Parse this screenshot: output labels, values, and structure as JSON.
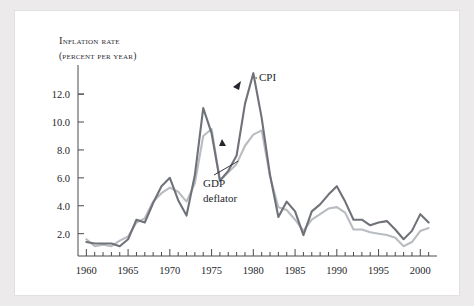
{
  "figure": {
    "title_line1": "Inflation rate",
    "title_line2": "(percent per year)"
  },
  "labels": {
    "cpi": "CPI",
    "gdp_line1": "GDP",
    "gdp_line2": "deflator"
  },
  "colors": {
    "cpi": "#6f7278",
    "gdp_deflator": "#b9bcc0",
    "axis": "#4a4a50",
    "text": "#25252b",
    "panel": "#ffffff",
    "page": "#eceaea"
  },
  "chart_data": {
    "type": "line",
    "title": "Inflation rate (percent per year)",
    "xlabel": "",
    "ylabel": "Inflation rate (percent per year)",
    "xlim": [
      1959,
      2002
    ],
    "ylim": [
      0.4,
      13.8
    ],
    "yticks": [
      2.0,
      4.0,
      6.0,
      8.0,
      10.0,
      12.0
    ],
    "ytick_labels": [
      "2.0",
      "4.0",
      "6.0",
      "8.0",
      "10.0",
      "12.0"
    ],
    "xticks": [
      1960,
      1965,
      1970,
      1975,
      1980,
      1985,
      1990,
      1995,
      2000
    ],
    "xtick_labels": [
      "1960",
      "1965",
      "1970",
      "1975",
      "1980",
      "1985",
      "1990",
      "1995",
      "2000"
    ],
    "minor_xtick_step": 1,
    "grid": false,
    "legend": "annotations",
    "x": [
      1960,
      1961,
      1962,
      1963,
      1964,
      1965,
      1966,
      1967,
      1968,
      1969,
      1970,
      1971,
      1972,
      1973,
      1974,
      1975,
      1976,
      1977,
      1978,
      1979,
      1980,
      1981,
      1982,
      1983,
      1984,
      1985,
      1986,
      1987,
      1988,
      1989,
      1990,
      1991,
      1992,
      1993,
      1994,
      1995,
      1996,
      1997,
      1998,
      1999,
      2000,
      2001
    ],
    "series": [
      {
        "name": "CPI",
        "color": "#6f7278",
        "values": [
          1.4,
          1.3,
          1.3,
          1.3,
          1.1,
          1.6,
          3.0,
          2.8,
          4.2,
          5.4,
          6.0,
          4.4,
          3.3,
          6.2,
          11.0,
          9.2,
          5.8,
          6.5,
          7.6,
          11.3,
          13.5,
          10.3,
          6.2,
          3.2,
          4.3,
          3.6,
          1.9,
          3.6,
          4.1,
          4.8,
          5.4,
          4.3,
          3.0,
          3.0,
          2.6,
          2.8,
          2.9,
          2.3,
          1.6,
          2.2,
          3.4,
          2.8
        ]
      },
      {
        "name": "GDP deflator",
        "color": "#b9bcc0",
        "values": [
          1.6,
          1.1,
          1.2,
          1.1,
          1.5,
          1.8,
          2.8,
          3.1,
          4.3,
          4.9,
          5.3,
          5.0,
          4.3,
          5.6,
          9.0,
          9.5,
          5.8,
          6.4,
          7.0,
          8.3,
          9.1,
          9.4,
          6.1,
          3.9,
          3.7,
          3.0,
          2.2,
          3.0,
          3.4,
          3.8,
          3.9,
          3.5,
          2.3,
          2.3,
          2.1,
          2.0,
          1.9,
          1.7,
          1.1,
          1.4,
          2.2,
          2.4
        ]
      }
    ],
    "annotations": [
      {
        "text": "CPI",
        "points_to": {
          "x": 1980,
          "y": 13.5
        }
      },
      {
        "text": "GDP deflator",
        "points_to": {
          "x": 1978,
          "y": 7.0
        }
      }
    ]
  }
}
